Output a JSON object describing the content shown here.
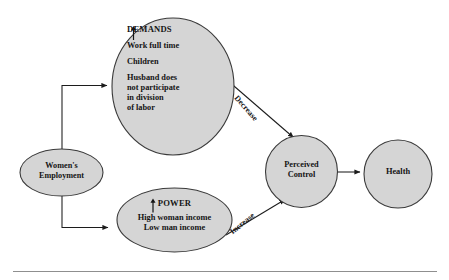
{
  "figure": {
    "type": "conceptual-path-diagram",
    "background_color": "#ffffff",
    "node_fill_color": "#d5d5d5",
    "node_stroke_color": "#333333",
    "text_color": "#141414",
    "footer_rule": true
  },
  "nodes": {
    "employment": {
      "name": "women-employment",
      "shape": "ellipse",
      "lines": [
        "Women's",
        "Employment"
      ]
    },
    "demands": {
      "name": "demands",
      "shape": "ellipse",
      "arrow_glyph": "↑",
      "heading": "DEMANDS",
      "items": [
        "Work full time",
        "Children",
        "Husband does",
        "not participate",
        "in division",
        "of labor"
      ]
    },
    "power": {
      "name": "power",
      "shape": "ellipse",
      "arrow_glyph": "↑",
      "heading": "POWER",
      "items": [
        "High woman income",
        "Low man income"
      ]
    },
    "perceived_control": {
      "name": "perceived-control",
      "shape": "circle",
      "lines": [
        "Perceived",
        "Control"
      ]
    },
    "health": {
      "name": "health",
      "shape": "circle",
      "lines": [
        "Health"
      ]
    }
  },
  "edges": [
    {
      "id": "employment-to-demands",
      "from": "employment",
      "to": "demands",
      "label": "",
      "style": "elbow-arrow"
    },
    {
      "id": "employment-to-power",
      "from": "employment",
      "to": "power",
      "label": "",
      "style": "elbow-arrow"
    },
    {
      "id": "demands-to-perceived-control",
      "from": "demands",
      "to": "perceived_control",
      "label": "Decrease",
      "style": "diagonal-arrow"
    },
    {
      "id": "power-to-perceived-control",
      "from": "power",
      "to": "perceived_control",
      "label": "Increase",
      "style": "diagonal-arrow"
    },
    {
      "id": "perceived-control-to-health",
      "from": "perceived_control",
      "to": "health",
      "label": "",
      "style": "straight-arrow"
    }
  ],
  "edge_labels": {
    "decrease": "Decrease",
    "increase": "Increase"
  }
}
